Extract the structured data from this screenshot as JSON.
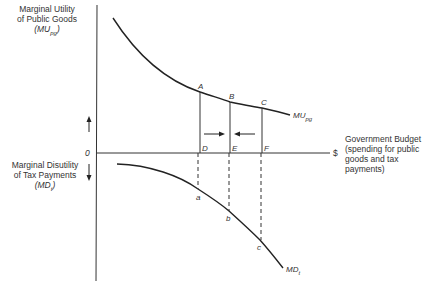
{
  "axes": {
    "y_label_top": [
      "Marginal Utility",
      "of Public Goods",
      "(MUpg)"
    ],
    "y_label_bottom": [
      "Marginal Disutility",
      "of Tax Payments",
      "(MDt)"
    ],
    "origin": "0",
    "x_unit": "$",
    "x_label": [
      "Government Budget",
      "(spending for public",
      "goods and tax",
      "payments)"
    ]
  },
  "curves": {
    "mu": "MUpg",
    "md": "MDt"
  },
  "points": {
    "upper": [
      "A",
      "B",
      "C"
    ],
    "axis": [
      "D",
      "E",
      "F"
    ],
    "lower": [
      "a",
      "b",
      "c"
    ]
  },
  "colors": {
    "line": "#222222",
    "background": "#ffffff"
  }
}
